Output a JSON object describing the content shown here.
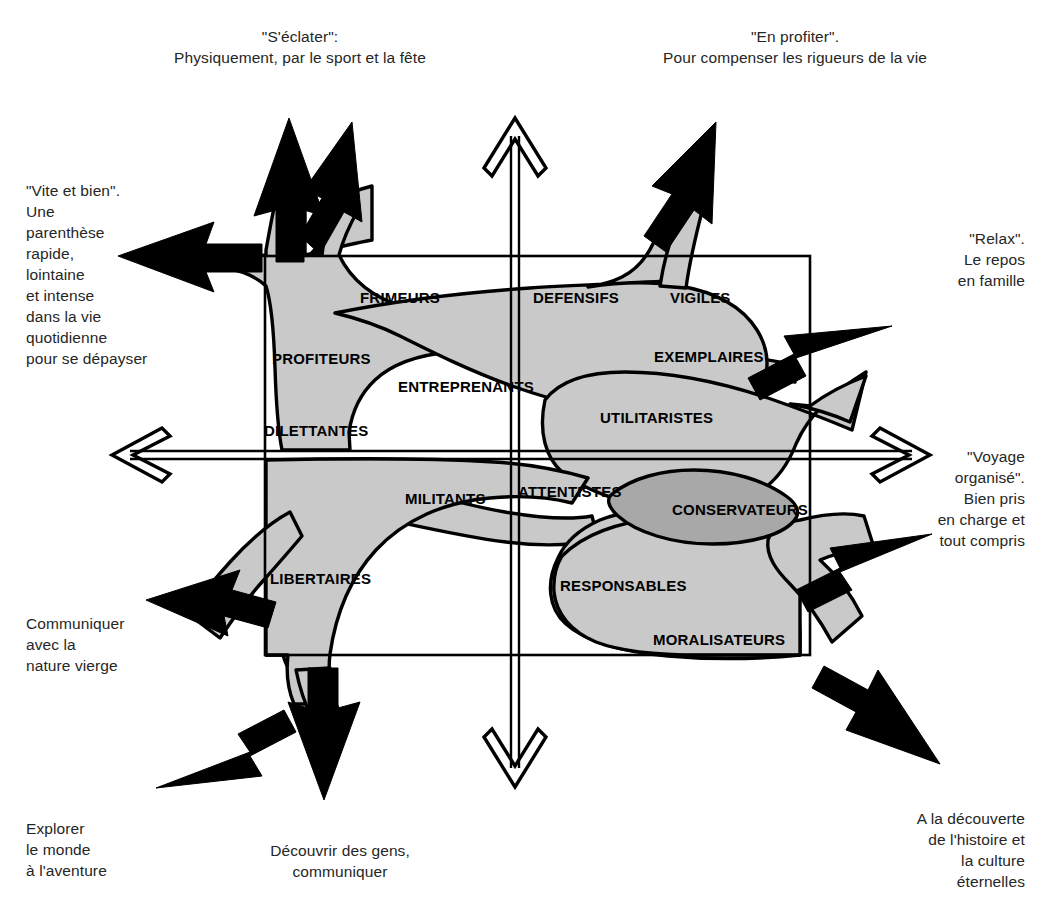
{
  "diagram": {
    "colors": {
      "background": "#ffffff",
      "blob_fill": "#c9c9c9",
      "blob_fill_dark": "#a5a5a5",
      "stroke": "#000000",
      "arrow_fill": "#000000",
      "text": "#262626",
      "segment_text": "#000000"
    }
  },
  "axis_labels": {
    "top_left": "\"S'éclater\":\nPhysiquement, par le sport et la fête",
    "top_right": "\"En profiter\".\nPour compenser les rigueurs de la vie",
    "left_upper": "\"Vite et bien\".\nUne\nparenthèse\nrapide,\nlointaine\net intense\ndans la vie\nquotidienne\npour se dépayser",
    "right_upper": "\"Relax\".\nLe repos\nen famille",
    "right_middle": "\"Voyage\norganisé\".\nBien pris\nen charge et\ntout compris",
    "left_lower": "Communiquer\navec la\nnature vierge",
    "bottom_left": "Explorer\nle monde\nà l'aventure",
    "bottom_middle": "Découvrir des gens,\ncommuniquer",
    "bottom_right": "A la découverte\nde l'histoire et\nla culture\néternelles"
  },
  "segments": [
    {
      "label": "FRIMEURS",
      "x": 360,
      "y": 289
    },
    {
      "label": "DEFENSIFS",
      "x": 533,
      "y": 289
    },
    {
      "label": "VIGILES",
      "x": 670,
      "y": 289
    },
    {
      "label": "PROFITEURS",
      "x": 272,
      "y": 350
    },
    {
      "label": "EXEMPLAIRES",
      "x": 654,
      "y": 348
    },
    {
      "label": "ENTREPRENANTS",
      "x": 398,
      "y": 378
    },
    {
      "label": "UTILITARISTES",
      "x": 600,
      "y": 409
    },
    {
      "label": "DILETTANTES",
      "x": 264,
      "y": 422
    },
    {
      "label": "ATTENTISTES",
      "x": 518,
      "y": 483
    },
    {
      "label": "MILITANTS",
      "x": 405,
      "y": 490
    },
    {
      "label": "CONSERVATEURS",
      "x": 672,
      "y": 501
    },
    {
      "label": "LIBERTAIRES",
      "x": 270,
      "y": 570
    },
    {
      "label": "RESPONSABLES",
      "x": 560,
      "y": 577
    },
    {
      "label": "MORALISATEURS",
      "x": 653,
      "y": 631
    }
  ],
  "axes": {
    "vertical": {
      "x": 515,
      "top": 114,
      "bottom": 786,
      "style": "double-line-outline-arrow",
      "arrow_ends": "both"
    },
    "horizontal": {
      "y": 455,
      "left": 108,
      "right": 934,
      "style": "double-line-outline-arrow",
      "arrow_ends": "both"
    }
  },
  "frame": {
    "left": 265,
    "top": 256,
    "right": 810,
    "bottom": 655
  },
  "outward_arrows": [
    {
      "name": "arrow-up-left-a",
      "direction": "up",
      "tip_x": 289,
      "tip_y": 122
    },
    {
      "name": "arrow-up-left-b",
      "direction": "up-right",
      "tip_x": 337,
      "tip_y": 128
    },
    {
      "name": "arrow-left",
      "direction": "left",
      "tip_x": 122,
      "tip_y": 256
    },
    {
      "name": "arrow-up-right",
      "direction": "up-right",
      "tip_x": 712,
      "tip_y": 128
    },
    {
      "name": "arrow-right-upper",
      "direction": "up-right",
      "tip_x": 888,
      "tip_y": 330
    },
    {
      "name": "arrow-right-lower",
      "direction": "up-right",
      "tip_x": 925,
      "tip_y": 538
    },
    {
      "name": "arrow-down-right",
      "direction": "down-right",
      "tip_x": 930,
      "tip_y": 760
    },
    {
      "name": "arrow-down-left",
      "direction": "down-left",
      "tip_x": 160,
      "tip_y": 790
    },
    {
      "name": "arrow-down",
      "direction": "down",
      "tip_x": 318,
      "tip_y": 800
    },
    {
      "name": "arrow-left-lower",
      "direction": "down-left",
      "tip_x": 150,
      "tip_y": 600
    }
  ]
}
